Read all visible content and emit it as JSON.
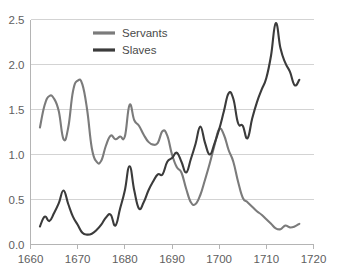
{
  "chart_data": {
    "type": "line",
    "title": "",
    "subtitle": "",
    "xlabel": "",
    "ylabel": "",
    "xlim": [
      1660,
      1720
    ],
    "ylim": [
      0.0,
      2.5
    ],
    "grid": true,
    "legend_position": "top-center",
    "x_ticks": [
      "1660",
      "1670",
      "1680",
      "1690",
      "1700",
      "1710",
      "1720"
    ],
    "x_tick_values": [
      1660,
      1670,
      1680,
      1690,
      1700,
      1710,
      1720
    ],
    "y_ticks": [
      "0.0",
      "0.5",
      "1.0",
      "1.5",
      "2.0",
      "2.5"
    ],
    "y_tick_values": [
      0.0,
      0.5,
      1.0,
      1.5,
      2.0,
      2.5
    ],
    "series": [
      {
        "name": "Servants",
        "color": "#7b7b7b",
        "x": [
          1662,
          1663,
          1664,
          1665,
          1666,
          1667,
          1668,
          1669,
          1670,
          1671,
          1672,
          1673,
          1674,
          1675,
          1676,
          1677,
          1678,
          1679,
          1680,
          1681,
          1682,
          1683,
          1684,
          1685,
          1686,
          1687,
          1688,
          1689,
          1690,
          1691,
          1692,
          1693,
          1694,
          1695,
          1696,
          1697,
          1698,
          1699,
          1700,
          1701,
          1702,
          1703,
          1704,
          1705,
          1706,
          1707,
          1708,
          1709,
          1710,
          1711,
          1712,
          1713,
          1714,
          1715,
          1716,
          1717
        ],
        "values": [
          1.3,
          1.55,
          1.65,
          1.62,
          1.48,
          1.17,
          1.3,
          1.7,
          1.82,
          1.78,
          1.5,
          1.07,
          0.92,
          0.93,
          1.1,
          1.21,
          1.17,
          1.2,
          1.2,
          1.55,
          1.38,
          1.32,
          1.22,
          1.14,
          1.11,
          1.13,
          1.26,
          1.21,
          1.0,
          0.86,
          0.8,
          0.62,
          0.47,
          0.45,
          0.55,
          0.72,
          0.9,
          1.1,
          1.28,
          1.22,
          1.05,
          0.92,
          0.7,
          0.52,
          0.47,
          0.42,
          0.37,
          0.33,
          0.28,
          0.23,
          0.18,
          0.17,
          0.21,
          0.19,
          0.2,
          0.23
        ]
      },
      {
        "name": "Slaves",
        "color": "#3b3b3b",
        "x": [
          1662,
          1663,
          1664,
          1665,
          1666,
          1667,
          1668,
          1669,
          1670,
          1671,
          1672,
          1673,
          1674,
          1675,
          1676,
          1677,
          1678,
          1679,
          1680,
          1681,
          1682,
          1683,
          1684,
          1685,
          1686,
          1687,
          1688,
          1689,
          1690,
          1691,
          1692,
          1693,
          1694,
          1695,
          1696,
          1697,
          1698,
          1699,
          1700,
          1701,
          1702,
          1703,
          1704,
          1705,
          1706,
          1707,
          1708,
          1709,
          1710,
          1711,
          1712,
          1713,
          1714,
          1715,
          1716,
          1717
        ],
        "values": [
          0.2,
          0.31,
          0.26,
          0.35,
          0.46,
          0.6,
          0.45,
          0.31,
          0.22,
          0.13,
          0.11,
          0.12,
          0.16,
          0.22,
          0.3,
          0.33,
          0.21,
          0.4,
          0.6,
          0.87,
          0.6,
          0.4,
          0.47,
          0.6,
          0.7,
          0.78,
          0.78,
          0.92,
          0.96,
          1.02,
          0.92,
          0.8,
          0.95,
          1.12,
          1.31,
          1.13,
          1.0,
          1.12,
          1.28,
          1.48,
          1.68,
          1.62,
          1.35,
          1.32,
          1.18,
          1.4,
          1.58,
          1.72,
          1.85,
          2.1,
          2.46,
          2.18,
          2.02,
          1.92,
          1.77,
          1.83
        ]
      }
    ],
    "legend": [
      {
        "label": "Servants",
        "color": "#7b7b7b"
      },
      {
        "label": "Slaves",
        "color": "#3b3b3b"
      }
    ]
  }
}
